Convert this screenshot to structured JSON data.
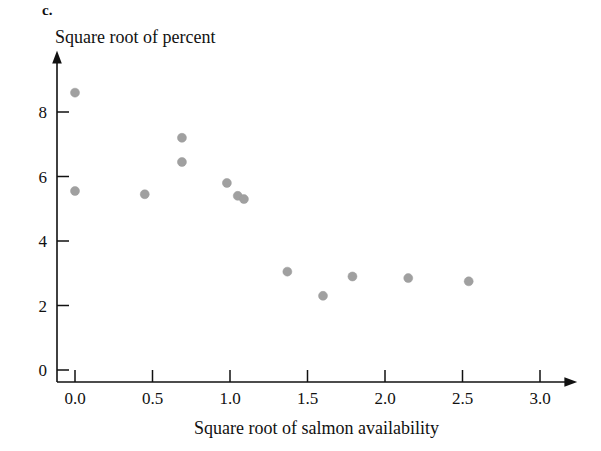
{
  "figure": {
    "panel_letter": "c.",
    "y_axis_title": "Square root of percent",
    "x_axis_title": "Square root of salmon availability"
  },
  "chart_data": {
    "type": "scatter",
    "title": "",
    "xlabel": "Square root of salmon availability",
    "ylabel": "Square root of percent",
    "xlim": [
      0.0,
      3.1
    ],
    "ylim": [
      0.0,
      9.2
    ],
    "xticks": [
      "0.0",
      "0.5",
      "1.0",
      "1.5",
      "2.0",
      "2.5",
      "3.0"
    ],
    "xtick_values": [
      0.0,
      0.5,
      1.0,
      1.5,
      2.0,
      2.5,
      3.0
    ],
    "yticks": [
      "0",
      "2",
      "4",
      "6",
      "8"
    ],
    "ytick_values": [
      0,
      2,
      4,
      6,
      8
    ],
    "grid": false,
    "legend": "none",
    "marker_color": "#a0a0a0",
    "marker_size": 9,
    "x": [
      0.0,
      0.0,
      0.45,
      0.69,
      0.69,
      0.98,
      1.05,
      1.09,
      1.37,
      1.6,
      1.79,
      2.15,
      2.54
    ],
    "y": [
      8.6,
      5.55,
      5.45,
      7.2,
      6.45,
      5.8,
      5.4,
      5.3,
      3.05,
      2.3,
      2.9,
      2.85,
      2.75
    ],
    "points": [
      {
        "x": 0.0,
        "y": 8.6
      },
      {
        "x": 0.0,
        "y": 5.55
      },
      {
        "x": 0.45,
        "y": 5.45
      },
      {
        "x": 0.69,
        "y": 7.2
      },
      {
        "x": 0.69,
        "y": 6.45
      },
      {
        "x": 0.98,
        "y": 5.8
      },
      {
        "x": 1.05,
        "y": 5.4
      },
      {
        "x": 1.09,
        "y": 5.3
      },
      {
        "x": 1.37,
        "y": 3.05
      },
      {
        "x": 1.6,
        "y": 2.3
      },
      {
        "x": 1.79,
        "y": 2.9
      },
      {
        "x": 2.15,
        "y": 2.85
      },
      {
        "x": 2.54,
        "y": 2.75
      }
    ]
  },
  "axes_geometry": {
    "x_origin_px": 75,
    "y_origin_px": 370,
    "x_scale_px_per_unit": 155,
    "y_scale_px_per_unit": 32.25,
    "axis_vertical_x_px": 57,
    "axis_horizontal_y_px": 382
  }
}
